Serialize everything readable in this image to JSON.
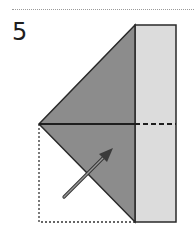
{
  "step": {
    "number": "5"
  },
  "colors": {
    "dark_fill": "#8c8c8c",
    "light_fill": "#dcdcdc",
    "stroke": "#2a2a2a",
    "arrow": "#555555"
  },
  "diagram": {
    "elements": [
      "folded-triangle",
      "vertical-strip",
      "horizontal-crease",
      "dashed-hidden-crease",
      "dotted-outline-original-position",
      "fold-arrow"
    ]
  }
}
